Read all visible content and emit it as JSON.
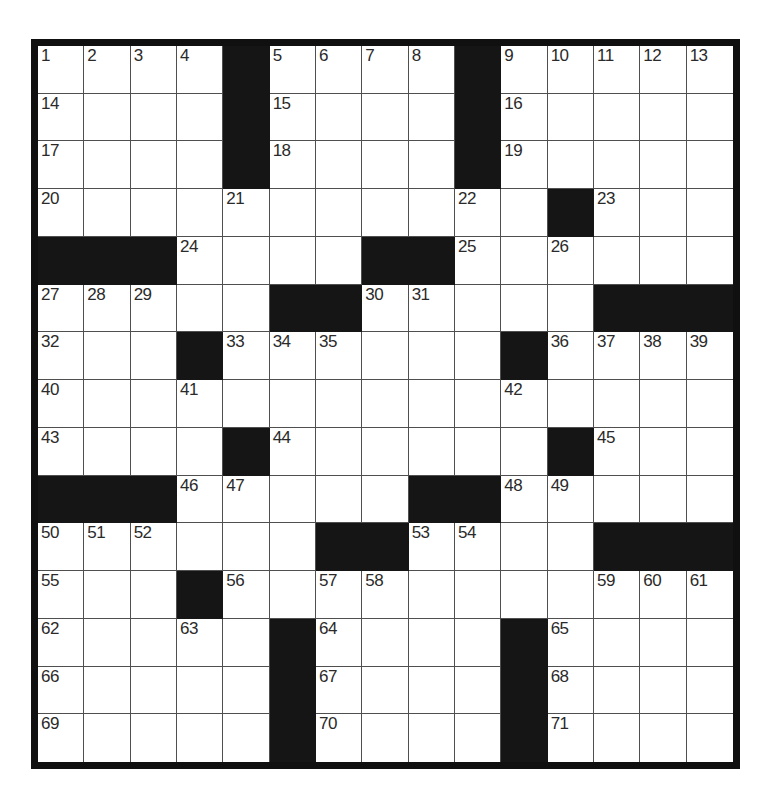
{
  "puzzle": {
    "type": "crossword",
    "rows": 15,
    "cols": 15,
    "black_cell_symbol": "#",
    "first_number": "1",
    "last_number": "71",
    "grid": [
      [
        "1",
        "2",
        "3",
        "4",
        "#",
        "5",
        "6",
        "7",
        "8",
        "#",
        "9",
        "10",
        "11",
        "12",
        "13"
      ],
      [
        "14",
        "",
        "",
        "",
        "#",
        "15",
        "",
        "",
        "",
        "#",
        "16",
        "",
        "",
        "",
        ""
      ],
      [
        "17",
        "",
        "",
        "",
        "#",
        "18",
        "",
        "",
        "",
        "#",
        "19",
        "",
        "",
        "",
        ""
      ],
      [
        "20",
        "",
        "",
        "",
        "21",
        "",
        "",
        "",
        "",
        "22",
        "",
        "#",
        "23",
        "",
        ""
      ],
      [
        "#",
        "#",
        "#",
        "24",
        "",
        "",
        "",
        "#",
        "#",
        "25",
        "",
        "26",
        "",
        "",
        ""
      ],
      [
        "27",
        "28",
        "29",
        "",
        "",
        "#",
        "#",
        "30",
        "31",
        "",
        "",
        "",
        "#",
        "#",
        "#"
      ],
      [
        "32",
        "",
        "",
        "#",
        "33",
        "34",
        "35",
        "",
        "",
        "",
        "#",
        "36",
        "37",
        "38",
        "39"
      ],
      [
        "40",
        "",
        "",
        "41",
        "",
        "",
        "",
        "",
        "",
        "",
        "42",
        "",
        "",
        "",
        ""
      ],
      [
        "43",
        "",
        "",
        "",
        "#",
        "44",
        "",
        "",
        "",
        "",
        "",
        "#",
        "45",
        "",
        ""
      ],
      [
        "#",
        "#",
        "#",
        "46",
        "47",
        "",
        "",
        "",
        "#",
        "#",
        "48",
        "49",
        "",
        "",
        ""
      ],
      [
        "50",
        "51",
        "52",
        "",
        "",
        "",
        "#",
        "#",
        "53",
        "54",
        "",
        "",
        "#",
        "#",
        "#"
      ],
      [
        "55",
        "",
        "",
        "#",
        "56",
        "",
        "57",
        "58",
        "",
        "",
        "",
        "",
        "59",
        "60",
        "61"
      ],
      [
        "62",
        "",
        "",
        "63",
        "",
        "#",
        "64",
        "",
        "",
        "",
        "#",
        "65",
        "",
        "",
        ""
      ],
      [
        "66",
        "",
        "",
        "",
        "",
        "#",
        "67",
        "",
        "",
        "",
        "#",
        "68",
        "",
        "",
        ""
      ],
      [
        "69",
        "",
        "",
        "",
        "",
        "#",
        "70",
        "",
        "",
        "",
        "#",
        "71",
        "",
        "",
        ""
      ]
    ],
    "colors": {
      "page_background": "#ffffff",
      "cell_background": "#ffffff",
      "black_cell": "#151515",
      "grid_line": "#4f4f4f",
      "outer_border": "#101010",
      "number_text": "#2a2a2a"
    }
  }
}
